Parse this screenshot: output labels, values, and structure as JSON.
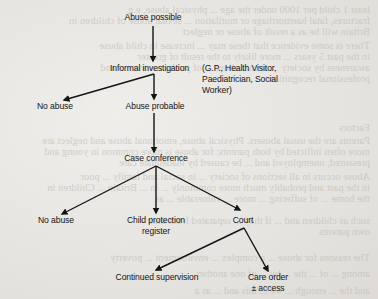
{
  "diagram": {
    "type": "flowchart",
    "colors": {
      "paper": "#e9e7e3",
      "ink": "#141414",
      "bleed_through": "#b9b6b0"
    },
    "nodes": {
      "abuse_possible": "Abuse possible",
      "informal_investigation": "Informal investigation",
      "informal_investigation_note": [
        "(G.P., Health Visitor,",
        "Paediatrician, Social",
        "Worker)"
      ],
      "no_abuse_1": "No abuse",
      "abuse_probable": "Abuse probable",
      "case_conference": "Case conference",
      "no_abuse_2": "No abuse",
      "child_protection_register": [
        "Child protection",
        "register"
      ],
      "court": "Court",
      "continued_supervision": "Continued supervision",
      "care_order": [
        "Care order",
        "± access"
      ]
    },
    "edges": [
      {
        "from": "Abuse possible",
        "to": "Informal investigation"
      },
      {
        "from": "Informal investigation",
        "to": "No abuse"
      },
      {
        "from": "Informal investigation",
        "to": "Abuse probable"
      },
      {
        "from": "Abuse probable",
        "to": "Case conference"
      },
      {
        "from": "Case conference",
        "to": "No abuse"
      },
      {
        "from": "Case conference",
        "to": "Child protection register"
      },
      {
        "from": "Case conference",
        "to": "Court"
      },
      {
        "from": "Court",
        "to": "Continued supervision"
      },
      {
        "from": "Court",
        "to": "Care order ± access"
      }
    ]
  },
  "bleed_through_lines": [
    "least 1 child per 1000 under the age   ...   physical abuse, e.g.",
    "fractures, fatal haemorrhage or mutilation ... sexual abuse of children in",
    "Britain will be as a result of abuse or neglect",
    "There is some evidence that these may ... increase in child abuse",
    "in the past 5 years ... more likely to the result of greater",
    "awareness by society ... sexual abuse ... of public awareness and",
    "professional recognition",
    "Factors",
    "Parents are the usual abusers. Physical abuse, emotional abuse and neglect are",
    "more often inflicted by both parents; for abuse is more common in young and",
    "pressured, unemployed and ... be caused by inadequate care",
    "Abuse occurs in all sections of society ... in social and family ... poor",
    "in the past and probably much more commonly ... in ... Britain ... Children in",
    "the home ... of suffering ... more ... vulnerable ... as",
    "such as children and ... if they ... separated from their",
    "own parents",
    "The reasons for abuse ... a complex ... environment ... poverty",
    "among ... of ... the ... by ... of one another",
    "and the ... enough ... we ... this and ... as a"
  ]
}
